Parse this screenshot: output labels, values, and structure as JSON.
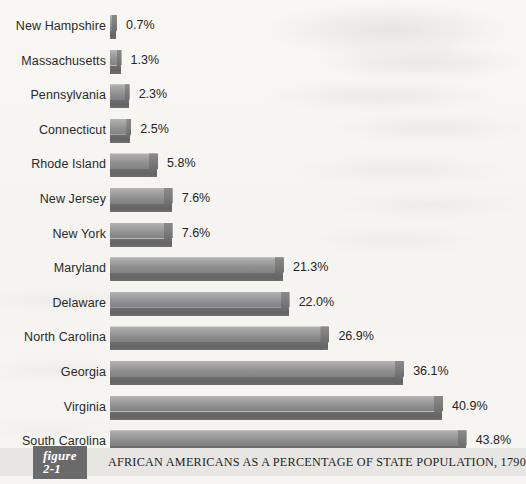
{
  "figure": {
    "number_label": "figure 2-1",
    "caption": "AFRICAN AMERICANS AS A PERCENTAGE OF STATE POPULATION, 1790"
  },
  "chart_data": {
    "type": "bar",
    "orientation": "horizontal",
    "title": "AFRICAN AMERICANS AS A PERCENTAGE OF STATE POPULATION, 1790",
    "xlabel": "",
    "ylabel": "",
    "grid": false,
    "legend": "none",
    "xlim": [
      0,
      43.8
    ],
    "value_suffix": "%",
    "categories": [
      "New Hampshire",
      "Massachusetts",
      "Pennsylvania",
      "Connecticut",
      "Rhode Island",
      "New Jersey",
      "New York",
      "Maryland",
      "Delaware",
      "North Carolina",
      "Georgia",
      "Virginia",
      "South Carolina"
    ],
    "values": [
      0.7,
      1.3,
      2.3,
      2.5,
      5.8,
      7.6,
      7.6,
      21.3,
      22.0,
      26.9,
      36.1,
      40.9,
      43.8
    ],
    "value_labels": [
      "0.7%",
      "1.3%",
      "2.3%",
      "2.5%",
      "5.8%",
      "7.6%",
      "7.6%",
      "21.3%",
      "22.0%",
      "26.9%",
      "36.1%",
      "40.9%",
      "43.8%"
    ],
    "bar_color_top": "#b4b4b4",
    "bar_color_bottom": "#646464",
    "background_color": "#f7f6f3",
    "text_color": "#2a2a2a"
  }
}
